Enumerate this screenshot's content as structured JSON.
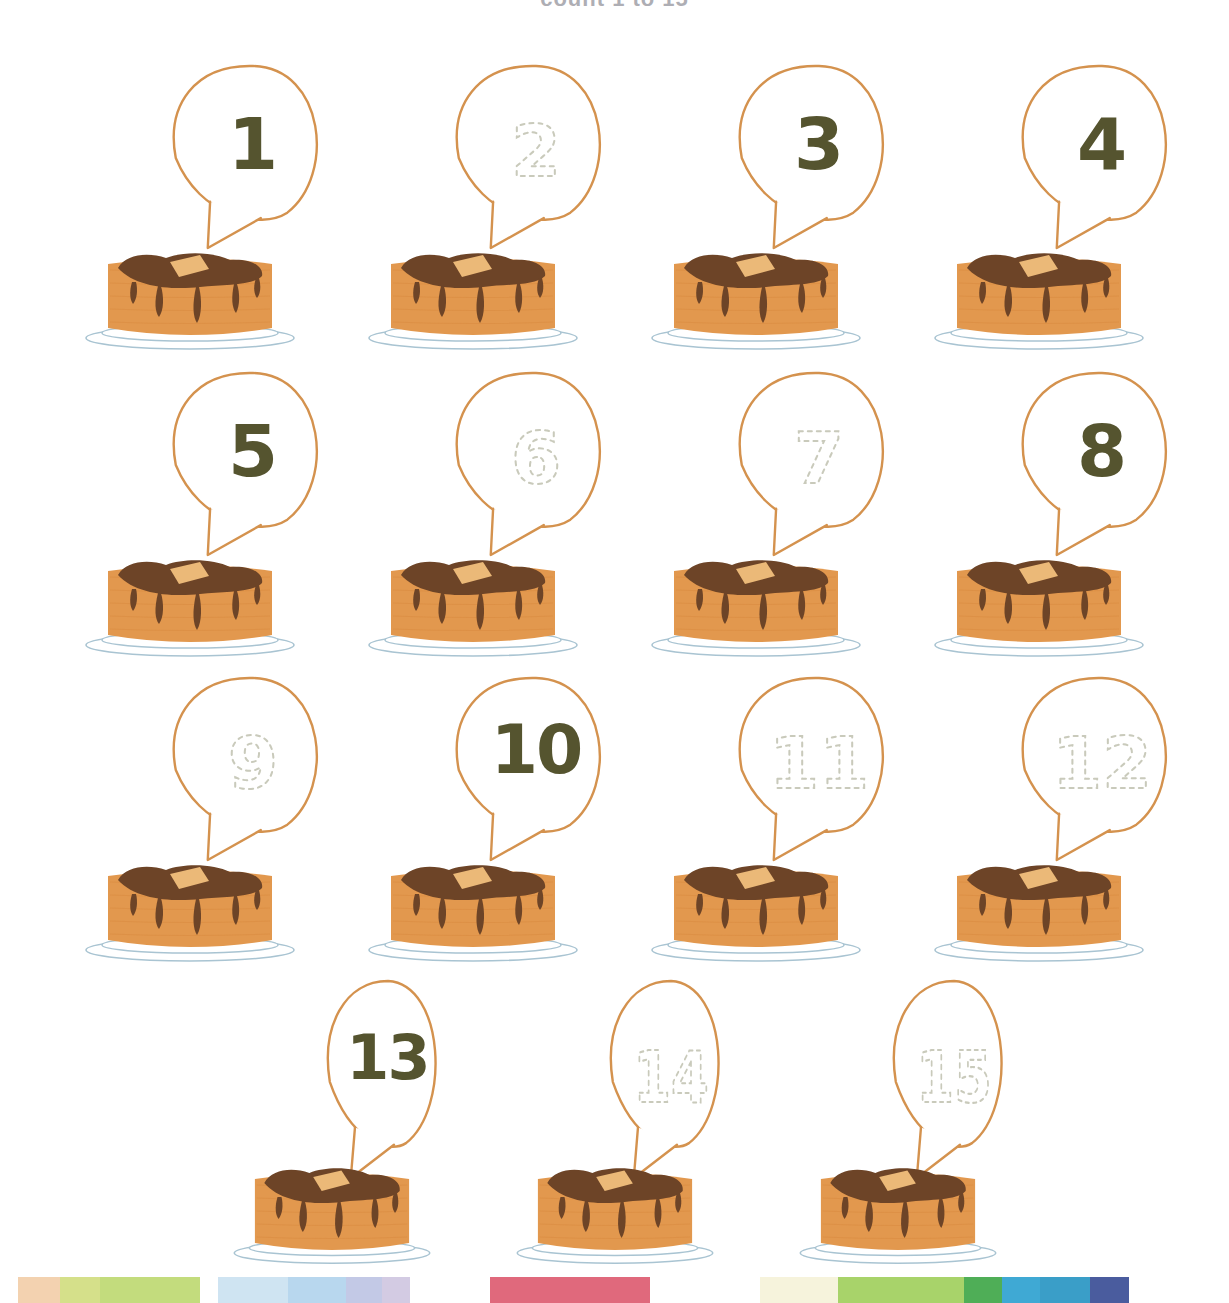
{
  "worksheet": {
    "title": "count 1 to 15",
    "instruction_visible": false,
    "page_width": 1229,
    "page_height": 1303
  },
  "colors": {
    "number_solid": "#55542f",
    "number_trace": "#c9cabb",
    "balloon_outline": "#d4924e",
    "pancake_body": "#e2984e",
    "pancake_body_shade": "#d98b3f",
    "chocolate": "#6d4427",
    "chocolate_dark": "#5e3a20",
    "butter": "#ebb978",
    "plate": "#a9c4d2",
    "background": "#ffffff"
  },
  "items": [
    {
      "number": "1",
      "mode": "solid",
      "row": 1,
      "col": 1
    },
    {
      "number": "2",
      "mode": "trace",
      "row": 1,
      "col": 2
    },
    {
      "number": "3",
      "mode": "solid",
      "row": 1,
      "col": 3
    },
    {
      "number": "4",
      "mode": "solid",
      "row": 1,
      "col": 4
    },
    {
      "number": "5",
      "mode": "solid",
      "row": 2,
      "col": 1
    },
    {
      "number": "6",
      "mode": "trace",
      "row": 2,
      "col": 2
    },
    {
      "number": "7",
      "mode": "trace",
      "row": 2,
      "col": 3
    },
    {
      "number": "8",
      "mode": "solid",
      "row": 2,
      "col": 4
    },
    {
      "number": "9",
      "mode": "trace",
      "row": 3,
      "col": 1
    },
    {
      "number": "10",
      "mode": "solid",
      "row": 3,
      "col": 2
    },
    {
      "number": "11",
      "mode": "trace",
      "row": 3,
      "col": 3
    },
    {
      "number": "12",
      "mode": "trace",
      "row": 3,
      "col": 4
    },
    {
      "number": "13",
      "mode": "solid",
      "row": 4,
      "col": 1
    },
    {
      "number": "14",
      "mode": "trace",
      "row": 4,
      "col": 2
    },
    {
      "number": "15",
      "mode": "trace",
      "row": 4,
      "col": 3
    }
  ],
  "rows": [
    {
      "index": 1,
      "count": 4
    },
    {
      "index": 2,
      "count": 4
    },
    {
      "index": 3,
      "count": 4
    },
    {
      "index": 4,
      "count": 3
    }
  ],
  "color_bar": [
    {
      "name": "white-left",
      "color": "#ffffff",
      "width": 18
    },
    {
      "name": "peach",
      "color": "#f3d2b0",
      "width": 42
    },
    {
      "name": "yellow-green",
      "color": "#d5e08a",
      "width": 40
    },
    {
      "name": "light-green",
      "color": "#c3dc7d",
      "width": 100
    },
    {
      "name": "white-gap-1",
      "color": "#ffffff",
      "width": 18
    },
    {
      "name": "pale-blue",
      "color": "#cfe4f2",
      "width": 70
    },
    {
      "name": "sky-blue",
      "color": "#b8d7ee",
      "width": 58
    },
    {
      "name": "periwinkle",
      "color": "#c3c9e6",
      "width": 36
    },
    {
      "name": "lavender",
      "color": "#d3cbe3",
      "width": 28
    },
    {
      "name": "white-gap-2",
      "color": "#ffffff",
      "width": 80
    },
    {
      "name": "rose-red",
      "color": "#e0697c",
      "width": 160
    },
    {
      "name": "white-gap-3",
      "color": "#ffffff",
      "width": 110
    },
    {
      "name": "cream",
      "color": "#f6f3dc",
      "width": 78
    },
    {
      "name": "apple-green",
      "color": "#a8d36a",
      "width": 126
    },
    {
      "name": "green",
      "color": "#4fae57",
      "width": 38
    },
    {
      "name": "cyan",
      "color": "#3fa9d4",
      "width": 38
    },
    {
      "name": "teal-blue",
      "color": "#3a9ec8",
      "width": 50
    },
    {
      "name": "indigo",
      "color": "#4a5c9e",
      "width": 39
    },
    {
      "name": "white-right",
      "color": "#ffffff",
      "width": 100
    }
  ]
}
